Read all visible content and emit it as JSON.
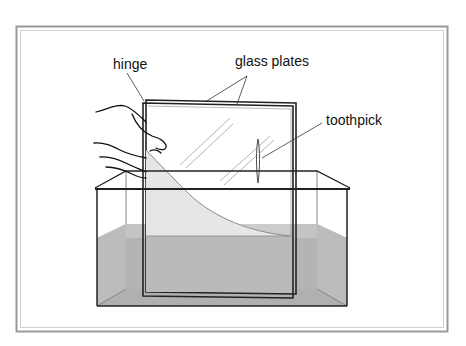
{
  "figure": {
    "labels": {
      "hinge": "hinge",
      "glass_plates": "glass plates",
      "toothpick": "toothpick"
    }
  },
  "colors": {
    "background": "#ffffff",
    "frame_outer": "#9a9a9a",
    "frame_inner": "#c8c8c8",
    "line": "#222222",
    "thin_line": "#555555",
    "water": "#b4b4b4",
    "water_dark": "#a8a8a8",
    "water_between_plates": "#ebebeb",
    "glass_reflection": "#b8b8b8"
  }
}
